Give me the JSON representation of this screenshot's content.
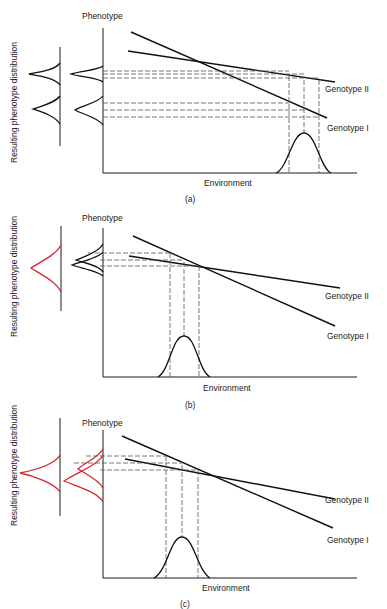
{
  "figure": {
    "side_label": "Resulting phenotype distribution",
    "colors": {
      "ink": "#111111",
      "dash": "#555555",
      "highlight": "#d8262f",
      "background": "#ffffff"
    },
    "panels": [
      {
        "id": "a",
        "caption": "(a)",
        "y_axis_label": "Phenotype",
        "x_axis_label": "Environment",
        "genotype_labels": [
          "Genotype II",
          "Genotype I"
        ],
        "distribution_color": "black",
        "description": "Environment distribution lies far right of crossover; genotypes yield two separated phenotype distributions"
      },
      {
        "id": "b",
        "caption": "(b)",
        "y_axis_label": "Phenotype",
        "x_axis_label": "Environment",
        "genotype_labels": [
          "Genotype II",
          "Genotype I"
        ],
        "distribution_color": "black (individual) / red (resulting)",
        "description": "Environment distribution centered near crossover; genotype phenotype distributions overlap into a single distribution"
      },
      {
        "id": "c",
        "caption": "(c)",
        "y_axis_label": "Phenotype",
        "x_axis_label": "Environment",
        "genotype_labels": [
          "Genotype II",
          "Genotype I"
        ],
        "distribution_color": "red",
        "description": "Environment distribution left of crossover; phenotype distributions partially overlap"
      }
    ]
  }
}
